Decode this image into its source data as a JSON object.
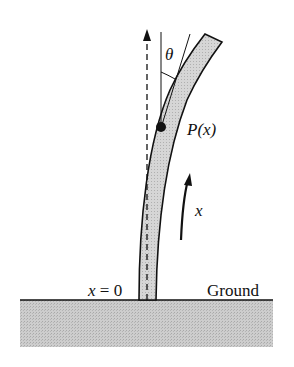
{
  "diagram": {
    "labels": {
      "theta": "θ",
      "point": "P(x)",
      "x_arrow": "x",
      "origin": "x = 0",
      "ground": "Ground"
    },
    "colors": {
      "ink": "#111111",
      "pole_fill": "#d2d2d2",
      "ground_fill": "#c6c6c6",
      "background": "#ffffff"
    }
  }
}
